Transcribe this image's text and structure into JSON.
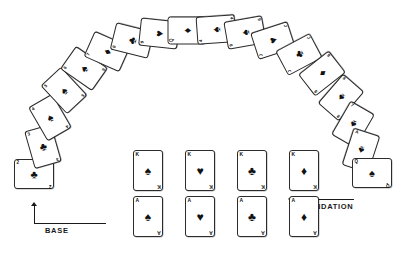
{
  "diagram": {
    "labels": {
      "base": "BASE",
      "foundation": "FOUNDATION"
    },
    "suit_glyphs": {
      "spades": "♠",
      "hearts": "♥",
      "clubs": "♣",
      "diamonds": "♦"
    },
    "colors": {
      "ink": "#111111",
      "card_border": "#2b2b2b",
      "card_face": "#ffffff",
      "background": "#ffffff"
    }
  },
  "arc": {
    "name": "tableau-arc",
    "count": 19,
    "cards": [
      {
        "rank": "2",
        "suit": "clubs",
        "glyph": "♣",
        "x": 14,
        "y": 159,
        "w": 40,
        "h": 30,
        "rot": 0,
        "z": 1
      },
      {
        "rank": "3",
        "suit": "clubs",
        "glyph": "♣",
        "x": 29,
        "y": 127,
        "w": 40,
        "h": 30,
        "rot": -16,
        "z": 2
      },
      {
        "rank": "4",
        "suit": "spades",
        "glyph": "♠",
        "x": 36,
        "y": 98,
        "w": 39,
        "h": 30,
        "rot": -30,
        "z": 3
      },
      {
        "rank": "5",
        "suit": "spades",
        "glyph": "♠",
        "x": 50,
        "y": 71,
        "w": 38,
        "h": 31,
        "rot": -43,
        "z": 4
      },
      {
        "rank": "6",
        "suit": "spades",
        "glyph": "♠",
        "x": 70,
        "y": 49,
        "w": 36,
        "h": 33,
        "rot": -55,
        "z": 5
      },
      {
        "rank": "7",
        "suit": "diamonds",
        "glyph": "♦",
        "x": 93,
        "y": 32,
        "w": 34,
        "h": 35,
        "rot": -66,
        "z": 6
      },
      {
        "rank": "8",
        "suit": "clubs",
        "glyph": "♣",
        "x": 118,
        "y": 21,
        "w": 32,
        "h": 37,
        "rot": -76,
        "z": 7
      },
      {
        "rank": "9",
        "suit": "hearts",
        "glyph": "♥",
        "x": 145,
        "y": 14,
        "w": 30,
        "h": 39,
        "rot": -84,
        "z": 8
      },
      {
        "rank": "Q",
        "suit": "diamonds",
        "glyph": "♦",
        "x": 173,
        "y": 11,
        "w": 29,
        "h": 39,
        "rot": -90,
        "z": 9
      },
      {
        "rank": "4",
        "suit": "spades",
        "glyph": "♠",
        "x": 202,
        "y": 10,
        "w": 28,
        "h": 40,
        "rot": -94,
        "z": 10
      },
      {
        "rank": "9",
        "suit": "spades",
        "glyph": "♠",
        "x": 231,
        "y": 13,
        "w": 29,
        "h": 39,
        "rot": -100,
        "z": 11
      },
      {
        "rank": "J",
        "suit": "hearts",
        "glyph": "♥",
        "x": 259,
        "y": 21,
        "w": 31,
        "h": 38,
        "rot": -108,
        "z": 12
      },
      {
        "rank": "J",
        "suit": "clubs",
        "glyph": "♣",
        "x": 285,
        "y": 35,
        "w": 33,
        "h": 36,
        "rot": -118,
        "z": 13
      },
      {
        "rank": "9",
        "suit": "diamonds",
        "glyph": "♦",
        "x": 308,
        "y": 54,
        "w": 35,
        "h": 34,
        "rot": -128,
        "z": 14
      },
      {
        "rank": "8",
        "suit": "spades",
        "glyph": "♠",
        "x": 327,
        "y": 78,
        "w": 37,
        "h": 32,
        "rot": -139,
        "z": 15
      },
      {
        "rank": "7",
        "suit": "spades",
        "glyph": "♠",
        "x": 339,
        "y": 105,
        "w": 39,
        "h": 31,
        "rot": -150,
        "z": 16
      },
      {
        "rank": "A",
        "suit": "spades",
        "glyph": "♠",
        "x": 347,
        "y": 131,
        "w": 40,
        "h": 30,
        "rot": -162,
        "z": 17
      },
      {
        "rank": "Q",
        "suit": "spades",
        "glyph": "♠",
        "x": 352,
        "y": 158,
        "w": 40,
        "h": 30,
        "rot": 0,
        "z": 18
      }
    ]
  },
  "foundation": {
    "name": "foundation-grid",
    "rows": [
      {
        "row_name": "kings-row",
        "cards": [
          {
            "rank": "K",
            "suit": "spades",
            "glyph": "♠"
          },
          {
            "rank": "K",
            "suit": "hearts",
            "glyph": "♥"
          },
          {
            "rank": "K",
            "suit": "clubs",
            "glyph": "♣"
          },
          {
            "rank": "K",
            "suit": "diamonds",
            "glyph": "♦"
          }
        ]
      },
      {
        "row_name": "aces-row",
        "cards": [
          {
            "rank": "A",
            "suit": "spades",
            "glyph": "♠"
          },
          {
            "rank": "A",
            "suit": "hearts",
            "glyph": "♥"
          },
          {
            "rank": "A",
            "suit": "clubs",
            "glyph": "♣"
          },
          {
            "rank": "A",
            "suit": "diamonds",
            "glyph": "♦"
          }
        ]
      }
    ]
  }
}
